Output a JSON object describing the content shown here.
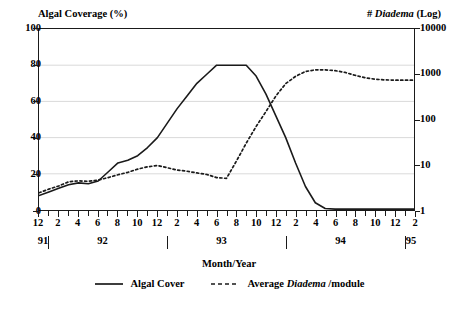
{
  "chart_data": {
    "type": "line",
    "title": "",
    "xlabel": "Month/Year",
    "left_axis_title": "Algal Coverage (%)",
    "right_axis_title_prefix": "# ",
    "right_axis_title_italic": "Diadema",
    "right_axis_title_suffix": " (Log)",
    "grid": true,
    "legend_position": "bottom",
    "y_left": {
      "label": "Algal Coverage (%)",
      "scale": "linear",
      "ylim": [
        0,
        100
      ],
      "ticks": [
        0,
        20,
        40,
        60,
        80,
        100
      ],
      "tick_labels": [
        "0",
        "20",
        "40",
        "60",
        "80",
        "100"
      ]
    },
    "y_right": {
      "label": "# Diadema (Log)",
      "scale": "log",
      "ylim": [
        1,
        10000
      ],
      "ticks": [
        1,
        10,
        100,
        1000,
        10000
      ],
      "tick_labels": [
        "1",
        "10",
        "100",
        "1000",
        "10000"
      ]
    },
    "x": {
      "label": "Month/Year",
      "tick_labels": [
        "12",
        "",
        "2",
        "",
        "4",
        "",
        "6",
        "",
        "8",
        "",
        "10",
        "",
        "12",
        "",
        "2",
        "",
        "4",
        "",
        "6",
        "",
        "8",
        "",
        "10",
        "",
        "12",
        "",
        "2",
        "",
        "4",
        "",
        "6",
        "",
        "8",
        "",
        "10",
        "",
        "12",
        "",
        "2"
      ],
      "month_sequence": [
        12,
        1,
        2,
        3,
        4,
        5,
        6,
        7,
        8,
        9,
        10,
        11,
        12,
        1,
        2,
        3,
        4,
        5,
        6,
        7,
        8,
        9,
        10,
        11,
        12,
        1,
        2,
        3,
        4,
        5,
        6,
        7,
        8,
        9,
        10,
        11,
        12,
        1,
        2
      ],
      "years": [
        {
          "label": "91",
          "center_index": 0.5
        },
        {
          "label": "92",
          "center_index": 6.5
        },
        {
          "label": "93",
          "center_index": 18.5
        },
        {
          "label": "94",
          "center_index": 30.5
        },
        {
          "label": "95",
          "center_index": 37.6
        }
      ],
      "year_separators": [
        1.0,
        13.0,
        25.0,
        37.0
      ]
    },
    "series": [
      {
        "name": "Algal Cover",
        "style": "solid",
        "axis": "left",
        "color": "#1a1a1a",
        "values": [
          8,
          10,
          12,
          14,
          15,
          14.5,
          16,
          21,
          26,
          27.5,
          30,
          34.5,
          40,
          48,
          56,
          63,
          70,
          75,
          80,
          80,
          80,
          80,
          74,
          64,
          52,
          40,
          26,
          13,
          4,
          0.8,
          0.5,
          0.5,
          0.5,
          0.5,
          0.5,
          0.5,
          0.5,
          0.5,
          0.5
        ]
      },
      {
        "name": "Average Diadema /module",
        "style": "dashed",
        "axis": "right",
        "color": "#1a1a1a",
        "values": [
          2.4,
          2.9,
          3.4,
          4.2,
          4.4,
          4.3,
          4.6,
          5.2,
          6.0,
          6.8,
          8.0,
          9.0,
          9.6,
          8.6,
          7.6,
          7.2,
          6.6,
          6.1,
          5.2,
          5.0,
          12,
          30,
          70,
          150,
          330,
          620,
          900,
          1150,
          1250,
          1250,
          1200,
          1100,
          950,
          840,
          780,
          750,
          740,
          740,
          740
        ]
      }
    ],
    "legend": [
      {
        "name": "Algal Cover",
        "style": "solid"
      },
      {
        "name_prefix": "Average ",
        "name_italic": "Diadema",
        "name_suffix": " /module",
        "style": "dashed"
      }
    ]
  }
}
